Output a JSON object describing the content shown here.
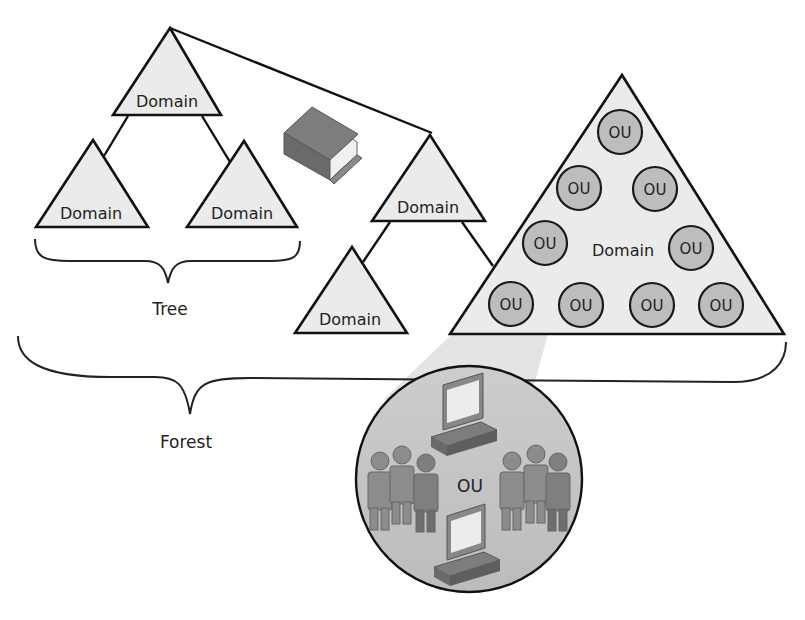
{
  "diagram": {
    "colors": {
      "triangle_fill": "#ebebeb",
      "outline": "#111111",
      "ou_fill": "#bdbdbd",
      "zoom_circle_fill": "#c4c4c4",
      "zoom_beam": "#e2e2e2",
      "book_cover": "#7a7a7a",
      "book_pages": "#f2f2f2"
    },
    "tree": {
      "root_domain": "Domain",
      "child_domain_left": "Domain",
      "child_domain_right": "Domain",
      "label": "Tree"
    },
    "second_tree": {
      "root_domain": "Domain",
      "child_domain_left": "Domain"
    },
    "large_domain": {
      "label": "Domain",
      "ous": [
        "OU",
        "OU",
        "OU",
        "OU",
        "OU",
        "OU",
        "OU",
        "OU",
        "OU"
      ]
    },
    "forest": {
      "label": "Forest"
    },
    "ou_detail": {
      "label": "OU",
      "icons": [
        "computer-icon",
        "users-group-icon",
        "users-group-icon",
        "computer-icon"
      ]
    },
    "schema_icon": "book-icon"
  }
}
